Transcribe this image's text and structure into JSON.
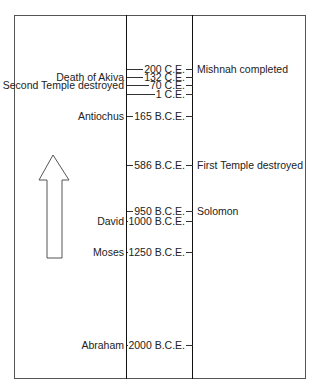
{
  "diagram": {
    "type": "timeline",
    "direction_arrow": "up-arrow",
    "events": [
      {
        "date": "200 C.E.",
        "left": "",
        "right": "Mishnah completed",
        "y": 69
      },
      {
        "date": "132 C.E.",
        "left": "Death of  Akiva",
        "right": "",
        "y": 77
      },
      {
        "date": "70 C.E.",
        "left": "Second Temple destroyed",
        "right": "",
        "y": 85
      },
      {
        "date": "1 C.E.",
        "left": "",
        "right": "",
        "y": 94
      },
      {
        "date": "165 B.C.E.",
        "left": "Antiochus",
        "right": "",
        "y": 116
      },
      {
        "date": "586 B.C.E.",
        "left": "",
        "right": "First Temple destroyed",
        "y": 165
      },
      {
        "date": "950 B.C.E.",
        "left": "",
        "right": "Solomon",
        "y": 211
      },
      {
        "date": "1000 B.C.E.",
        "left": "David",
        "right": "",
        "y": 221
      },
      {
        "date": "1250 B.C.E.",
        "left": "Moses",
        "right": "",
        "y": 252
      },
      {
        "date": "2000 B.C.E.",
        "left": "Abraham",
        "right": "",
        "y": 345
      }
    ]
  }
}
